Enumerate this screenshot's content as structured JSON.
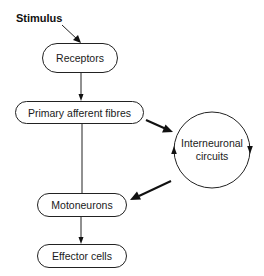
{
  "diagram": {
    "type": "flowchart",
    "input_label": "Stimulus",
    "nodes": [
      {
        "id": "receptors",
        "label": "Receptors",
        "shape": "rounded-rect"
      },
      {
        "id": "primary_afferent",
        "label": "Primary afferent fibres",
        "shape": "rounded-rect"
      },
      {
        "id": "interneuronal",
        "label_line1": "Interneuronal",
        "label_line2": "circuits",
        "shape": "circle-cyclic"
      },
      {
        "id": "motoneurons",
        "label": "Motoneurons",
        "shape": "rounded-rect"
      },
      {
        "id": "effector",
        "label": "Effector cells",
        "shape": "rounded-rect"
      }
    ],
    "edges": [
      {
        "from": "Stimulus",
        "to": "receptors",
        "style": "arrow"
      },
      {
        "from": "receptors",
        "to": "primary_afferent",
        "style": "arrow"
      },
      {
        "from": "primary_afferent",
        "to": "interneuronal",
        "style": "bold-arrow"
      },
      {
        "from": "primary_afferent",
        "to": "motoneurons",
        "style": "line"
      },
      {
        "from": "interneuronal",
        "to": "motoneurons",
        "style": "bold-arrow"
      },
      {
        "from": "motoneurons",
        "to": "effector",
        "style": "arrow"
      }
    ],
    "colors": {
      "stroke": "#222222",
      "background": "#ffffff",
      "text": "#1a1a1a"
    }
  }
}
